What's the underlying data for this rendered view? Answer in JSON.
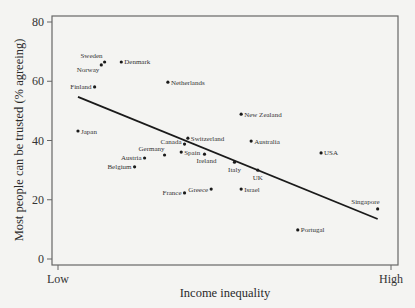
{
  "chart_data": {
    "type": "scatter",
    "title": "",
    "xlabel": "Income inequality",
    "ylabel": "Most people can be trusted (% agreeing)",
    "x_tick_labels": [
      "Low",
      "High"
    ],
    "y_ticks": [
      0,
      20,
      40,
      60,
      80
    ],
    "ylim": [
      0,
      80
    ],
    "xlim": [
      0,
      1
    ],
    "grid": false,
    "legend": null,
    "points": [
      {
        "name": "Sweden",
        "x": 0.14,
        "y": 66.5
      },
      {
        "name": "Norway",
        "x": 0.13,
        "y": 65.5
      },
      {
        "name": "Denmark",
        "x": 0.19,
        "y": 66.5
      },
      {
        "name": "Finland",
        "x": 0.11,
        "y": 58.1
      },
      {
        "name": "Netherlands",
        "x": 0.33,
        "y": 59.7
      },
      {
        "name": "Japan",
        "x": 0.06,
        "y": 43.2
      },
      {
        "name": "New Zealand",
        "x": 0.55,
        "y": 48.9
      },
      {
        "name": "Switzerland",
        "x": 0.39,
        "y": 40.8
      },
      {
        "name": "Australia",
        "x": 0.58,
        "y": 39.8
      },
      {
        "name": "Canada",
        "x": 0.38,
        "y": 38.8
      },
      {
        "name": "USA",
        "x": 0.79,
        "y": 35.8
      },
      {
        "name": "Germany",
        "x": 0.32,
        "y": 35.1
      },
      {
        "name": "Spain",
        "x": 0.37,
        "y": 36.1
      },
      {
        "name": "Ireland",
        "x": 0.44,
        "y": 35.4
      },
      {
        "name": "Austria",
        "x": 0.26,
        "y": 34.1
      },
      {
        "name": "Italy",
        "x": 0.53,
        "y": 32.7
      },
      {
        "name": "Belgium",
        "x": 0.23,
        "y": 31.1
      },
      {
        "name": "UK",
        "x": 0.6,
        "y": 30.0
      },
      {
        "name": "France",
        "x": 0.38,
        "y": 22.3
      },
      {
        "name": "Greece",
        "x": 0.46,
        "y": 23.6
      },
      {
        "name": "Israel",
        "x": 0.55,
        "y": 23.6
      },
      {
        "name": "Singapore",
        "x": 0.96,
        "y": 16.9
      },
      {
        "name": "Portugal",
        "x": 0.72,
        "y": 9.8
      }
    ],
    "trend_line": {
      "x": [
        0.06,
        0.96
      ],
      "y": [
        54.7,
        13.5
      ]
    }
  },
  "colors": {
    "background": "#f4f4f2",
    "axis": "#555555",
    "points": "#1a1a1a",
    "trend_line": "#1a1a1a"
  }
}
